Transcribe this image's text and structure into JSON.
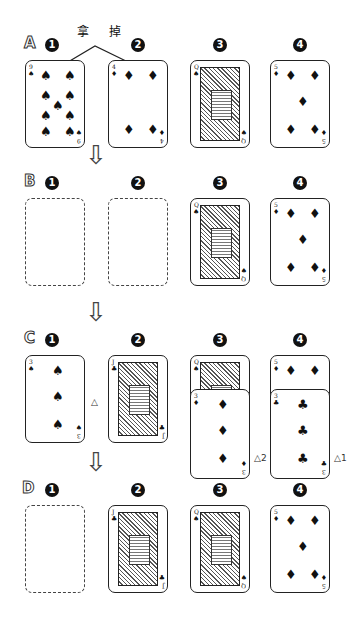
{
  "header": {
    "label": "拿 掉",
    "label_points_to": [
      "1",
      "2"
    ]
  },
  "rows": [
    {
      "letter": "A",
      "slots": [
        {
          "num": "1",
          "card": {
            "rank": "9",
            "suit": "♠"
          }
        },
        {
          "num": "2",
          "card": {
            "rank": "4",
            "suit": "♦"
          }
        },
        {
          "num": "3",
          "card": {
            "rank": "Q",
            "suit": "♠",
            "face": true
          }
        },
        {
          "num": "4",
          "card": {
            "rank": "5",
            "suit": "♦"
          }
        }
      ]
    },
    {
      "letter": "B",
      "slots": [
        {
          "num": "1",
          "empty": true
        },
        {
          "num": "2",
          "empty": true
        },
        {
          "num": "3",
          "card": {
            "rank": "Q",
            "suit": "♠",
            "face": true
          }
        },
        {
          "num": "4",
          "card": {
            "rank": "5",
            "suit": "♦"
          }
        }
      ]
    },
    {
      "letter": "C",
      "slots": [
        {
          "num": "1",
          "card": {
            "rank": "3",
            "suit": "♠"
          },
          "marker": "⚠"
        },
        {
          "num": "2",
          "card": {
            "rank": "J",
            "suit": "♣",
            "face": true
          }
        },
        {
          "num": "3",
          "card": {
            "rank": "Q",
            "suit": "♠",
            "face": true
          },
          "overlay": {
            "rank": "3",
            "suit": "♦"
          },
          "marker": "⚠2"
        },
        {
          "num": "4",
          "card": {
            "rank": "5",
            "suit": "♦"
          },
          "overlay": {
            "rank": "3",
            "suit": "♣"
          },
          "marker": "⚠1"
        }
      ]
    },
    {
      "letter": "D",
      "slots": [
        {
          "num": "1",
          "empty": true
        },
        {
          "num": "2",
          "card": {
            "rank": "J",
            "suit": "♣",
            "face": true
          }
        },
        {
          "num": "3",
          "card": {
            "rank": "Q",
            "suit": "♠",
            "face": true
          }
        },
        {
          "num": "4",
          "card": {
            "rank": "5",
            "suit": "♦"
          }
        }
      ]
    }
  ],
  "arrow_glyph": "⇩",
  "warn_glyph": "△"
}
